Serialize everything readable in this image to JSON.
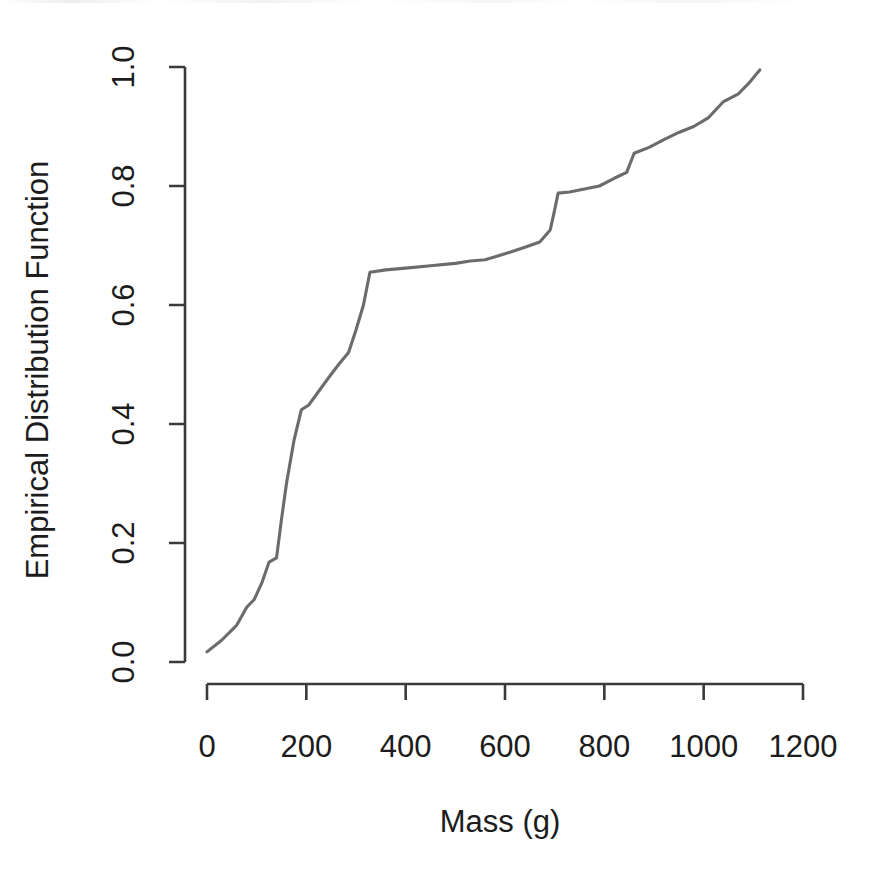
{
  "figure": {
    "width": 879,
    "height": 880,
    "background": "#ffffff",
    "line_color": "#6b6b6b",
    "axis_color": "#3a3a3a",
    "text_color": "#1c1c1c"
  },
  "chart_data": {
    "type": "line",
    "title": "",
    "subtitle": "",
    "xlabel": "Mass (g)",
    "ylabel": "Empirical Distribution Function",
    "xlim": [
      0,
      1200
    ],
    "ylim": [
      0.0,
      1.0
    ],
    "xticks": [
      0,
      200,
      400,
      600,
      800,
      1000,
      1200
    ],
    "xticklabels": [
      "0",
      "200",
      "400",
      "600",
      "800",
      "1000",
      "1200"
    ],
    "yticks": [
      0.0,
      0.2,
      0.4,
      0.6,
      0.8,
      1.0
    ],
    "yticklabels": [
      "0.0",
      "0.2",
      "0.4",
      "0.6",
      "0.8",
      "1.0"
    ],
    "grid": false,
    "legend": null,
    "legend_position": "none",
    "series": [
      {
        "name": "Empirical Distribution Function",
        "color": "#6b6b6b",
        "x": [
          0,
          30,
          60,
          80,
          95,
          110,
          125,
          140,
          150,
          160,
          175,
          190,
          205,
          225,
          245,
          265,
          285,
          300,
          315,
          328,
          360,
          400,
          450,
          500,
          530,
          560,
          600,
          640,
          670,
          691,
          700,
          707,
          730,
          760,
          790,
          820,
          845,
          860,
          890,
          920,
          950,
          980,
          1010,
          1040,
          1070,
          1090,
          1113
        ],
        "y": [
          0.017,
          0.037,
          0.062,
          0.092,
          0.105,
          0.132,
          0.168,
          0.175,
          0.24,
          0.3,
          0.372,
          0.424,
          0.432,
          0.455,
          0.478,
          0.5,
          0.52,
          0.558,
          0.6,
          0.655,
          0.659,
          0.662,
          0.666,
          0.67,
          0.674,
          0.676,
          0.686,
          0.697,
          0.706,
          0.726,
          0.76,
          0.788,
          0.79,
          0.795,
          0.8,
          0.813,
          0.823,
          0.855,
          0.865,
          0.878,
          0.89,
          0.9,
          0.915,
          0.942,
          0.955,
          0.972,
          0.995
        ]
      }
    ]
  },
  "axis_labels": {
    "x_title": "Mass (g)",
    "y_title": "Empirical Distribution Function"
  }
}
